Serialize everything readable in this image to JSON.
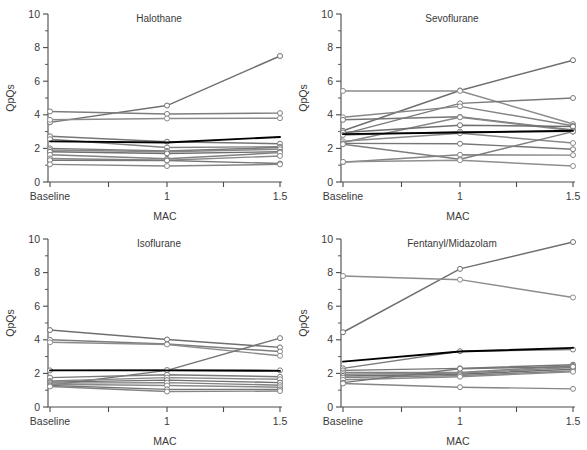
{
  "figure": {
    "width": 587,
    "height": 450,
    "background": "#ffffff",
    "line_color_default": "#7a7a7a",
    "mean_line_color": "#000000",
    "axis_color": "#4a4a4a",
    "marker_fill": "#ffffff"
  },
  "axes": {
    "ylabel": "QpQs",
    "xlabel": "MAC",
    "ylim": [
      0,
      10
    ],
    "y_major_ticks": [
      0,
      2,
      4,
      6,
      8,
      10
    ],
    "y_major_tick_labels": [
      "0",
      "2",
      "4",
      "6",
      "8",
      "10"
    ],
    "y_minor_ticks": [
      1,
      3,
      5,
      7,
      9
    ],
    "x_categories": [
      "Baseline",
      "1",
      "1.5"
    ],
    "x_tick_labels": [
      "Baseline",
      "1",
      "1.5"
    ],
    "grid": false,
    "legend": "none"
  },
  "chart_data": [
    {
      "type": "line",
      "title": "Halothane",
      "xlabel": "MAC",
      "ylabel": "QpQs",
      "categories": [
        "Baseline",
        "1",
        "1.5"
      ],
      "x": [
        0,
        1,
        1.5
      ],
      "ylim": [
        0,
        10
      ],
      "grid": false,
      "legend": "none",
      "series": [
        {
          "name": "subject-1",
          "values": [
            3.55,
            4.55,
            7.5
          ],
          "color": "#6f6f6f",
          "role": "subject"
        },
        {
          "name": "subject-2",
          "values": [
            4.2,
            4.05,
            4.1
          ],
          "color": "#7d7d7d",
          "role": "subject"
        },
        {
          "name": "subject-3",
          "values": [
            3.7,
            3.78,
            3.8
          ],
          "color": "#8c8c8c",
          "role": "subject"
        },
        {
          "name": "subject-4",
          "values": [
            2.72,
            2.4,
            2.28
          ],
          "color": "#757575",
          "role": "subject"
        },
        {
          "name": "subject-5",
          "values": [
            2.55,
            2.05,
            2.1
          ],
          "color": "#828282",
          "role": "subject"
        },
        {
          "name": "subject-6",
          "values": [
            2.0,
            1.85,
            2.05
          ],
          "color": "#7a7a7a",
          "role": "subject"
        },
        {
          "name": "subject-7",
          "values": [
            1.9,
            1.8,
            1.95
          ],
          "color": "#888888",
          "role": "subject"
        },
        {
          "name": "subject-8",
          "values": [
            1.8,
            1.7,
            1.8
          ],
          "color": "#6e6e6e",
          "role": "subject"
        },
        {
          "name": "subject-9",
          "values": [
            1.62,
            1.38,
            1.75
          ],
          "color": "#818181",
          "role": "subject"
        },
        {
          "name": "subject-10",
          "values": [
            1.4,
            1.3,
            1.55
          ],
          "color": "#8a8a8a",
          "role": "subject"
        },
        {
          "name": "subject-11",
          "values": [
            1.3,
            1.28,
            1.1
          ],
          "color": "#767676",
          "role": "subject"
        },
        {
          "name": "subject-12",
          "values": [
            1.05,
            0.95,
            1.05
          ],
          "color": "#858585",
          "role": "subject"
        },
        {
          "name": "mean",
          "values": [
            2.42,
            2.35,
            2.68
          ],
          "color": "#000000",
          "role": "mean"
        }
      ]
    },
    {
      "type": "line",
      "title": "Sevoflurane",
      "xlabel": "MAC",
      "ylabel": "QpQs",
      "categories": [
        "Baseline",
        "1",
        "1.5"
      ],
      "x": [
        0,
        1,
        1.5
      ],
      "ylim": [
        0,
        10
      ],
      "grid": false,
      "legend": "none",
      "series": [
        {
          "name": "subject-1",
          "values": [
            3.05,
            5.45,
            7.25
          ],
          "color": "#6f6f6f",
          "role": "subject"
        },
        {
          "name": "subject-2",
          "values": [
            5.42,
            5.42,
            3.45
          ],
          "color": "#8c8c8c",
          "role": "subject"
        },
        {
          "name": "subject-3",
          "values": [
            2.85,
            4.68,
            5.0
          ],
          "color": "#7a7a7a",
          "role": "subject"
        },
        {
          "name": "subject-4",
          "values": [
            3.85,
            4.5,
            3.35
          ],
          "color": "#848484",
          "role": "subject"
        },
        {
          "name": "subject-5",
          "values": [
            3.7,
            3.88,
            3.1
          ],
          "color": "#757575",
          "role": "subject"
        },
        {
          "name": "subject-6",
          "values": [
            2.35,
            3.85,
            3.05
          ],
          "color": "#888888",
          "role": "subject"
        },
        {
          "name": "subject-7",
          "values": [
            2.95,
            3.38,
            3.3
          ],
          "color": "#6e6e6e",
          "role": "subject"
        },
        {
          "name": "subject-8",
          "values": [
            2.8,
            3.0,
            3.0
          ],
          "color": "#818181",
          "role": "subject"
        },
        {
          "name": "subject-9",
          "values": [
            2.42,
            2.9,
            2.32
          ],
          "color": "#8a8a8a",
          "role": "subject"
        },
        {
          "name": "subject-10",
          "values": [
            2.3,
            2.28,
            1.95
          ],
          "color": "#767676",
          "role": "subject"
        },
        {
          "name": "subject-11",
          "values": [
            1.18,
            1.62,
            1.6
          ],
          "color": "#858585",
          "role": "subject"
        },
        {
          "name": "subject-12",
          "values": [
            2.25,
            1.35,
            3.0
          ],
          "color": "#7d7d7d",
          "role": "subject"
        },
        {
          "name": "subject-13",
          "values": [
            1.2,
            1.3,
            0.95
          ],
          "color": "#8f8f8f",
          "role": "subject"
        },
        {
          "name": "mean",
          "values": [
            2.85,
            2.95,
            3.05
          ],
          "color": "#000000",
          "role": "mean"
        }
      ]
    },
    {
      "type": "line",
      "title": "Isoflurane",
      "xlabel": "MAC",
      "ylabel": "QpQs",
      "categories": [
        "Baseline",
        "1",
        "1.5"
      ],
      "x": [
        0,
        1,
        1.5
      ],
      "ylim": [
        0,
        10
      ],
      "grid": false,
      "legend": "none",
      "series": [
        {
          "name": "subject-1",
          "values": [
            4.58,
            4.02,
            3.55
          ],
          "color": "#6f6f6f",
          "role": "subject"
        },
        {
          "name": "subject-2",
          "values": [
            4.0,
            3.75,
            3.3
          ],
          "color": "#7d7d7d",
          "role": "subject"
        },
        {
          "name": "subject-3",
          "values": [
            3.85,
            3.72,
            3.05
          ],
          "color": "#8c8c8c",
          "role": "subject"
        },
        {
          "name": "subject-4",
          "values": [
            1.3,
            2.18,
            4.1
          ],
          "color": "#757575",
          "role": "subject"
        },
        {
          "name": "subject-5",
          "values": [
            2.18,
            2.2,
            2.18
          ],
          "color": "#828282",
          "role": "subject"
        },
        {
          "name": "subject-6",
          "values": [
            1.75,
            1.92,
            1.8
          ],
          "color": "#7a7a7a",
          "role": "subject"
        },
        {
          "name": "subject-7",
          "values": [
            1.55,
            1.75,
            1.65
          ],
          "color": "#888888",
          "role": "subject"
        },
        {
          "name": "subject-8",
          "values": [
            1.48,
            1.6,
            1.45
          ],
          "color": "#6e6e6e",
          "role": "subject"
        },
        {
          "name": "subject-9",
          "values": [
            1.42,
            1.45,
            1.3
          ],
          "color": "#818181",
          "role": "subject"
        },
        {
          "name": "subject-10",
          "values": [
            1.35,
            1.28,
            1.18
          ],
          "color": "#8a8a8a",
          "role": "subject"
        },
        {
          "name": "subject-11",
          "values": [
            1.28,
            1.05,
            1.05
          ],
          "color": "#767676",
          "role": "subject"
        },
        {
          "name": "subject-12",
          "values": [
            1.22,
            0.92,
            0.95
          ],
          "color": "#858585",
          "role": "subject"
        },
        {
          "name": "mean",
          "values": [
            2.18,
            2.18,
            2.15
          ],
          "color": "#000000",
          "role": "mean"
        }
      ]
    },
    {
      "type": "line",
      "title": "Fentanyl/Midazolam",
      "xlabel": "MAC",
      "ylabel": "QpQs",
      "categories": [
        "Baseline",
        "1",
        "1.5"
      ],
      "x": [
        0,
        1,
        1.5
      ],
      "ylim": [
        0,
        10
      ],
      "grid": false,
      "legend": "none",
      "series": [
        {
          "name": "subject-1",
          "values": [
            4.45,
            8.22,
            9.82
          ],
          "color": "#6f6f6f",
          "role": "subject"
        },
        {
          "name": "subject-2",
          "values": [
            7.8,
            7.58,
            6.52
          ],
          "color": "#8c8c8c",
          "role": "subject"
        },
        {
          "name": "subject-3",
          "values": [
            2.3,
            3.32,
            3.42
          ],
          "color": "#7a7a7a",
          "role": "subject"
        },
        {
          "name": "subject-4",
          "values": [
            2.18,
            2.3,
            2.52
          ],
          "color": "#757575",
          "role": "subject"
        },
        {
          "name": "subject-5",
          "values": [
            2.05,
            2.05,
            2.45
          ],
          "color": "#828282",
          "role": "subject"
        },
        {
          "name": "subject-6",
          "values": [
            1.95,
            2.02,
            2.35
          ],
          "color": "#888888",
          "role": "subject"
        },
        {
          "name": "subject-7",
          "values": [
            1.85,
            1.95,
            2.25
          ],
          "color": "#6e6e6e",
          "role": "subject"
        },
        {
          "name": "subject-8",
          "values": [
            1.75,
            1.88,
            2.15
          ],
          "color": "#818181",
          "role": "subject"
        },
        {
          "name": "subject-9",
          "values": [
            1.62,
            1.8,
            2.1
          ],
          "color": "#8a8a8a",
          "role": "subject"
        },
        {
          "name": "subject-10",
          "values": [
            1.45,
            2.28,
            2.4
          ],
          "color": "#767676",
          "role": "subject"
        },
        {
          "name": "subject-11",
          "values": [
            1.4,
            1.18,
            1.08
          ],
          "color": "#858585",
          "role": "subject"
        },
        {
          "name": "mean",
          "values": [
            2.7,
            3.3,
            3.52
          ],
          "color": "#000000",
          "role": "mean"
        }
      ]
    }
  ]
}
